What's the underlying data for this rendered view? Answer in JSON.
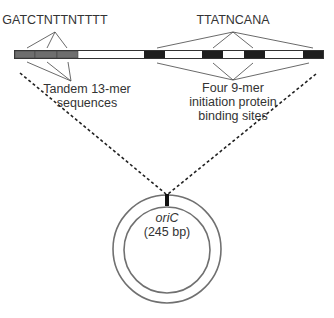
{
  "diagram": {
    "top_left_sequence": "GATCTNTTNTTTT",
    "top_right_sequence": "TTATNCANA",
    "left_label": [
      "Tandem 13-mer",
      "sequences"
    ],
    "right_label": [
      "Four 9-mer",
      "initiation protein",
      "binding sites"
    ],
    "circle_label_name": "oriC",
    "circle_label_size": "(245 bp)",
    "colors": {
      "tandem_segment": "#6e6e6e",
      "binding_site_segment": "#1e1e1e",
      "bar_background": "#ffffff",
      "lines": "#444444",
      "circle_stroke": "#707070"
    },
    "bar_segments": [
      {
        "type": "13-mer",
        "x": 15,
        "w": 20
      },
      {
        "type": "13-mer",
        "x": 35,
        "w": 22
      },
      {
        "type": "13-mer",
        "x": 57,
        "w": 21
      },
      {
        "type": "9-mer",
        "x": 144,
        "w": 21
      },
      {
        "type": "9-mer",
        "x": 202,
        "w": 21
      },
      {
        "type": "9-mer",
        "x": 244,
        "w": 21
      },
      {
        "type": "9-mer",
        "x": 303,
        "w": 20
      }
    ]
  }
}
